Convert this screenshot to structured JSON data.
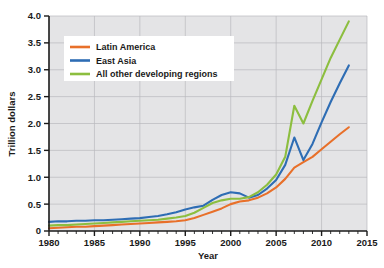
{
  "chart_data": {
    "type": "line",
    "title": "",
    "xlabel": "Year",
    "ylabel": "Trillion dollars",
    "xlim": [
      1980,
      2015
    ],
    "ylim": [
      0,
      4.0
    ],
    "grid": true,
    "legend_position": "upper-left-inside",
    "x_ticks": [
      "1980",
      "1985",
      "1990",
      "1995",
      "2000",
      "2005",
      "2010",
      "2015"
    ],
    "x_tick_values": [
      1980,
      1985,
      1990,
      1995,
      2000,
      2005,
      2010,
      2015
    ],
    "x_minor_tick_step": 1,
    "y_ticks": [
      "0",
      "0.5",
      "1.0",
      "1.5",
      "2.0",
      "2.5",
      "3.0",
      "3.5",
      "4.0"
    ],
    "y_tick_values": [
      0,
      0.5,
      1.0,
      1.5,
      2.0,
      2.5,
      3.0,
      3.5,
      4.0
    ],
    "x": [
      1980,
      1981,
      1982,
      1983,
      1984,
      1985,
      1986,
      1987,
      1988,
      1989,
      1990,
      1991,
      1992,
      1993,
      1994,
      1995,
      1996,
      1997,
      1998,
      1999,
      2000,
      2001,
      2002,
      2003,
      2004,
      2005,
      2006,
      2007,
      2008,
      2009,
      2010,
      2011,
      2012,
      2013
    ],
    "series": [
      {
        "name": "Latin America",
        "color": "#E8702A",
        "values": [
          0.05,
          0.06,
          0.07,
          0.08,
          0.08,
          0.09,
          0.1,
          0.11,
          0.12,
          0.13,
          0.14,
          0.15,
          0.16,
          0.17,
          0.18,
          0.2,
          0.24,
          0.3,
          0.36,
          0.42,
          0.5,
          0.55,
          0.57,
          0.62,
          0.7,
          0.81,
          0.97,
          1.18,
          1.28,
          1.38,
          1.52,
          1.66,
          1.8,
          1.93
        ]
      },
      {
        "name": "East Asia",
        "color": "#2E6DB4",
        "values": [
          0.17,
          0.18,
          0.18,
          0.19,
          0.19,
          0.2,
          0.2,
          0.21,
          0.22,
          0.23,
          0.24,
          0.26,
          0.28,
          0.31,
          0.35,
          0.4,
          0.44,
          0.47,
          0.58,
          0.67,
          0.72,
          0.7,
          0.62,
          0.67,
          0.79,
          0.95,
          1.23,
          1.74,
          1.32,
          1.62,
          2.02,
          2.4,
          2.75,
          3.08
        ]
      },
      {
        "name": "All other developing regions",
        "color": "#8CBE3F",
        "values": [
          0.1,
          0.11,
          0.11,
          0.12,
          0.13,
          0.14,
          0.15,
          0.16,
          0.17,
          0.18,
          0.19,
          0.2,
          0.21,
          0.23,
          0.25,
          0.28,
          0.34,
          0.43,
          0.52,
          0.57,
          0.6,
          0.6,
          0.63,
          0.72,
          0.86,
          1.05,
          1.38,
          2.33,
          2.0,
          2.42,
          2.82,
          3.22,
          3.56,
          3.9
        ]
      }
    ]
  },
  "legend": {
    "items": [
      {
        "label": "Latin America",
        "color": "#E8702A"
      },
      {
        "label": "East Asia",
        "color": "#2E6DB4"
      },
      {
        "label": "All other developing regions",
        "color": "#8CBE3F"
      }
    ]
  },
  "colors": {
    "plot_background": "#e4e4e6",
    "gridline": "#b9b9bd",
    "axis": "#1a1a1a",
    "legend_background": "#ffffff",
    "text": "#1a1a1a"
  }
}
